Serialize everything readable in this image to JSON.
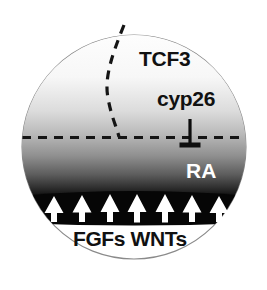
{
  "figure": {
    "type": "schematic-diagram",
    "background_color": "#ffffff",
    "outline_color": "#8a8a8a"
  },
  "labels": {
    "tcf3": "TCF3",
    "cyp26": "cyp26",
    "ra": "RA",
    "signals": "FGFs WNTs"
  },
  "shapes": {
    "circle": {
      "name": "embryo-circle",
      "cx": 134,
      "cy": 147,
      "r": 112,
      "fill": "none",
      "stroke": "#8a8a8a",
      "stroke_width": 1.1
    },
    "gradient": {
      "name": "ra-gradient",
      "description": "vertical grayscale gradient, white at top to black at bottom band",
      "top_color": "#fdfdfd",
      "mid_color": "#b8b8b8",
      "bottom_color": "#0a0a0a",
      "stops": [
        {
          "offset": 0,
          "color": "#fefefe"
        },
        {
          "offset": 28,
          "color": "#f7f7f7"
        },
        {
          "offset": 48,
          "color": "#dcdcdc"
        },
        {
          "offset": 62,
          "color": "#b9b9b9"
        },
        {
          "offset": 75,
          "color": "#8f8f8f"
        },
        {
          "offset": 86,
          "color": "#5d5d5d"
        },
        {
          "offset": 94,
          "color": "#2e2e2e"
        },
        {
          "offset": 100,
          "color": "#070707"
        }
      ]
    },
    "signal_band": {
      "name": "signal-source-band",
      "color": "#060606",
      "top_y": 194,
      "bottom_y": 222,
      "left_x": 30,
      "right_x": 238
    },
    "arrows": {
      "name": "signal-arrows",
      "count": 7,
      "color": "#ffffff",
      "direction": "up",
      "x_positions": [
        54,
        82,
        110,
        137,
        165,
        192,
        219
      ],
      "base_y": 221,
      "tip_y": 198
    },
    "boundary_curve": {
      "name": "tcf3-boundary-curve",
      "style": "dashed",
      "color": "#151515",
      "dash": "9 7",
      "stroke_width": 3.2
    },
    "horizontal_line": {
      "name": "ra-boundary-line",
      "style": "dashed",
      "color": "#151515",
      "dash": "9 7",
      "stroke_width": 3.2,
      "y": 137,
      "x_start": 24,
      "x_end": 246
    },
    "inhibition_symbol": {
      "name": "cyp26-inhibition-tbar",
      "color": "#0d0d0d",
      "stem_x": 190,
      "stem_top_y": 120,
      "stem_bottom_y": 145,
      "bar_half_width": 10,
      "bar_y": 145
    }
  }
}
